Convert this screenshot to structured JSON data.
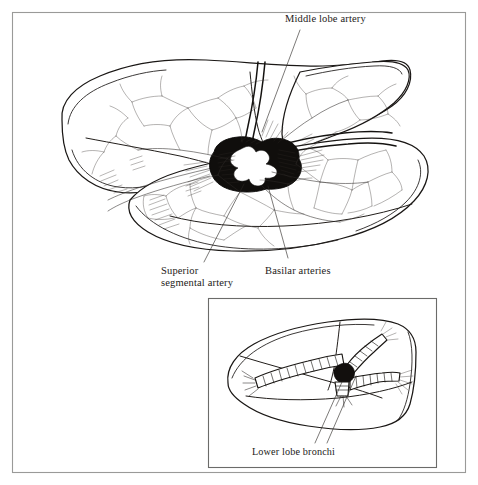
{
  "figure": {
    "background_color": "#ffffff",
    "ink_color": "#1a1715",
    "frame_color": "#9a9a98",
    "width": 478,
    "height": 485
  },
  "labels": {
    "middle_lobe_artery": "Middle lobe artery",
    "superior_segmental_artery_line1": "Superior",
    "superior_segmental_artery_line2": "segmental artery",
    "basilar_arteries": "Basilar arteries",
    "lower_lobe_bronchi": "Lower lobe bronchi"
  },
  "structures": {
    "upper_lobe": "upper-lobe",
    "middle_lobe": "middle-lobe",
    "lower_lobe": "lower-lobe",
    "hilum": "hilum",
    "pulmonary_artery_trunk": "pulmonary-artery-trunk",
    "vascular_network": "vascular-network"
  },
  "inset": {
    "subject": "lower-lobe-bronchi-detail",
    "border_color": "#6b6b69"
  }
}
